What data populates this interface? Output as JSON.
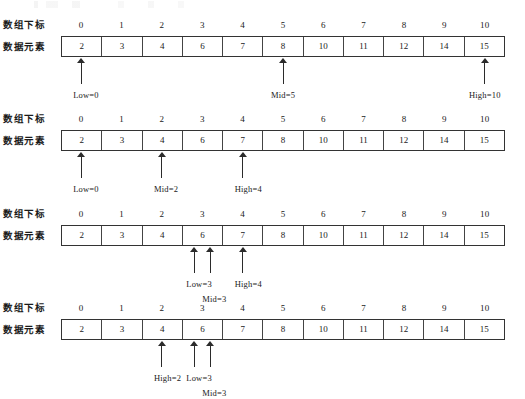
{
  "labels": {
    "index_row": "数组下标",
    "data_row": "数据元素"
  },
  "indices": [
    "0",
    "1",
    "2",
    "3",
    "4",
    "5",
    "6",
    "7",
    "8",
    "9",
    "10"
  ],
  "values": [
    "2",
    "3",
    "4",
    "6",
    "7",
    "8",
    "10",
    "11",
    "12",
    "14",
    "15"
  ],
  "blocks": [
    {
      "step": 1,
      "pointers": [
        {
          "name": "Low",
          "index": 0,
          "text": "Low=0",
          "align": "left",
          "tier": 0
        },
        {
          "name": "Mid",
          "index": 5,
          "text": "Mid=5",
          "align": "center",
          "tier": 0
        },
        {
          "name": "High",
          "index": 10,
          "text": "High=10",
          "align": "center",
          "tier": 0
        }
      ]
    },
    {
      "step": 2,
      "pointers": [
        {
          "name": "Low",
          "index": 0,
          "text": "Low=0",
          "align": "left",
          "tier": 0
        },
        {
          "name": "Mid",
          "index": 2,
          "text": "Mid=2",
          "align": "left",
          "tier": 0
        },
        {
          "name": "High",
          "index": 4,
          "text": "High=4",
          "align": "left",
          "tier": 0
        }
      ]
    },
    {
      "step": 3,
      "pointers": [
        {
          "name": "Low",
          "index": 3,
          "text": "Low=3",
          "align": "left",
          "tier": 0,
          "nudge": -8
        },
        {
          "name": "Mid",
          "index": 3,
          "text": "Mid=3",
          "align": "left",
          "tier": 1,
          "nudge": 8
        },
        {
          "name": "High",
          "index": 4,
          "text": "High=4",
          "align": "left",
          "tier": 0
        }
      ]
    },
    {
      "step": 4,
      "pointers": [
        {
          "name": "High",
          "index": 2,
          "text": "High=2",
          "align": "left",
          "tier": 0
        },
        {
          "name": "Low",
          "index": 3,
          "text": "Low=3",
          "align": "left",
          "tier": 0,
          "nudge": -8
        },
        {
          "name": "Mid",
          "index": 3,
          "text": "Mid=3",
          "align": "left",
          "tier": 1,
          "nudge": 8
        }
      ]
    }
  ],
  "colors": {
    "background": "#ffffff",
    "ink": "#1a1a1a",
    "table_border": "#333333",
    "cell_divider": "#444444",
    "arrow": "#2b2b2b"
  }
}
